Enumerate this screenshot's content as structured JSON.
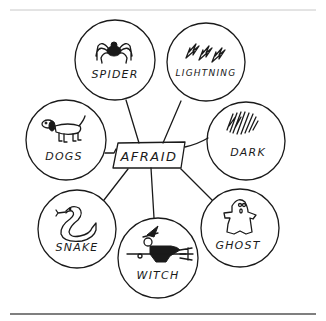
{
  "diagram": {
    "type": "mind-map",
    "center": {
      "label": "AFRAID"
    },
    "nodes": [
      {
        "id": "spider",
        "label": "SPIDER",
        "icon": "spider-icon"
      },
      {
        "id": "lightning",
        "label": "LIGHTNING",
        "icon": "lightning-icon"
      },
      {
        "id": "dark",
        "label": "DARK",
        "icon": "scribble-dark-icon"
      },
      {
        "id": "dogs",
        "label": "DOGS",
        "icon": "dog-icon"
      },
      {
        "id": "snake",
        "label": "SNAKE",
        "icon": "snake-icon"
      },
      {
        "id": "witch",
        "label": "WITCH",
        "icon": "witch-icon"
      },
      {
        "id": "ghost",
        "label": "GHOST",
        "icon": "ghost-icon"
      }
    ]
  },
  "colors": {
    "ink": "#1a1a1a",
    "background": "#ffffff",
    "top_rule": "#c8c8c8",
    "bottom_rule": "#555555"
  }
}
